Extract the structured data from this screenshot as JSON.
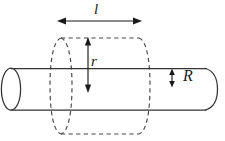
{
  "figure": {
    "name": "cylinder-through-dashed-cylinder-diagram",
    "background_color": "#ffffff",
    "stroke_color": "#333333",
    "dashed_stroke_color": "#444444",
    "labels": {
      "length": "l",
      "outer_radius": "r",
      "inner_radius": "R"
    },
    "dimension_arrows": [
      {
        "name": "length-arrow",
        "label": "l",
        "orientation": "horizontal",
        "double_headed": true,
        "x1": 58,
        "x2": 141,
        "y": 21
      },
      {
        "name": "outer-radius-arrow",
        "label": "r",
        "orientation": "vertical",
        "double_headed": true,
        "x": 88,
        "y1": 38,
        "y2": 92
      },
      {
        "name": "inner-radius-arrow",
        "label": "R",
        "orientation": "vertical",
        "double_headed": true,
        "x": 172,
        "y1": 69,
        "y2": 87
      }
    ],
    "solid_cylinder": {
      "name": "solid-cylinder",
      "top_edge_y": 68,
      "bottom_edge_y": 110,
      "left_cap_center_x": 11,
      "left_cap_rx": 10,
      "right_end_x": 205,
      "right_cap_bulge_x": 218
    },
    "dashed_cylinder": {
      "name": "dashed-cylinder",
      "left_ellipse_center_x": 61,
      "right_ellipse_center_x": 139,
      "ellipse_rx": 11,
      "top_y": 38,
      "bottom_y": 134
    }
  }
}
